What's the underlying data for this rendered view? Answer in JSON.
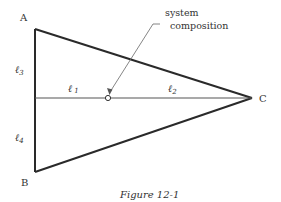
{
  "diagram": {
    "vertices": [
      {
        "id": "A",
        "label": "A"
      },
      {
        "id": "B",
        "label": "B"
      },
      {
        "id": "C",
        "label": "C"
      }
    ],
    "segments": {
      "l1": {
        "base": "ℓ",
        "sub": "1"
      },
      "l2": {
        "base": "ℓ",
        "sub": "2"
      },
      "l3": {
        "base": "ℓ",
        "sub": "3"
      },
      "l4": {
        "base": "ℓ",
        "sub": "4"
      }
    },
    "annotation": {
      "line1": "system",
      "line2": "composition"
    },
    "caption": "Figure 12-1",
    "colors": {
      "stroke": "#2a2a2a",
      "text": "#333333",
      "background": "#ffffff"
    }
  }
}
